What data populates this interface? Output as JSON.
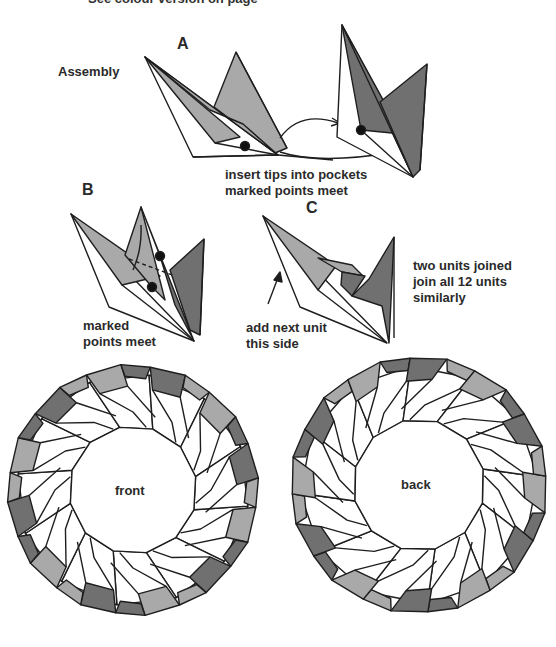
{
  "header": {
    "clipped_caption": "See colour version on page"
  },
  "colors": {
    "light": "#a9a9a9",
    "dark": "#707070",
    "line": "#1e1e1e",
    "paper": "#ffffff"
  },
  "step_a": {
    "label": "A",
    "section_title": "Assembly",
    "caption_line1": "insert tips into pockets",
    "caption_line2": "marked points meet"
  },
  "step_b": {
    "label": "B",
    "caption_line1": "marked",
    "caption_line2": "points meet"
  },
  "step_c": {
    "label": "C",
    "arrow_caption_line1": "add next unit",
    "arrow_caption_line2": "this side",
    "note_line1": "two units joined",
    "note_line2": "join all 12 units",
    "note_line3": "similarly"
  },
  "rings": [
    {
      "label": "front",
      "cx": 133,
      "cy": 490,
      "r_outer": 124,
      "r_inner": 64,
      "units": 12,
      "rotation": 8,
      "mirror": false
    },
    {
      "label": "back",
      "cx": 419,
      "cy": 485,
      "r_outer": 127,
      "r_inner": 66,
      "units": 12,
      "rotation": -4,
      "mirror": true
    }
  ]
}
